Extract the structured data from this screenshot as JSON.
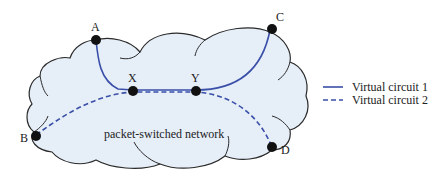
{
  "diagram": {
    "network_label": "packet-switched network",
    "nodes": [
      {
        "id": "A",
        "label": "A"
      },
      {
        "id": "B",
        "label": "B"
      },
      {
        "id": "C",
        "label": "C"
      },
      {
        "id": "D",
        "label": "D"
      },
      {
        "id": "X",
        "label": "X"
      },
      {
        "id": "Y",
        "label": "Y"
      }
    ],
    "circuits": [
      {
        "name": "Virtual circuit 1",
        "style": "solid",
        "path": [
          "A",
          "X",
          "Y",
          "C"
        ]
      },
      {
        "name": "Virtual circuit 2",
        "style": "dashed",
        "path": [
          "B",
          "X",
          "Y",
          "D"
        ]
      }
    ],
    "legend": {
      "item1": "Virtual circuit 1",
      "item2": "Virtual circuit 2"
    },
    "colors": {
      "cloud_fill": "#e6eef8",
      "cloud_stroke": "#2a2a2a",
      "circuit": "#3a4fa8",
      "node": "#111111"
    }
  }
}
